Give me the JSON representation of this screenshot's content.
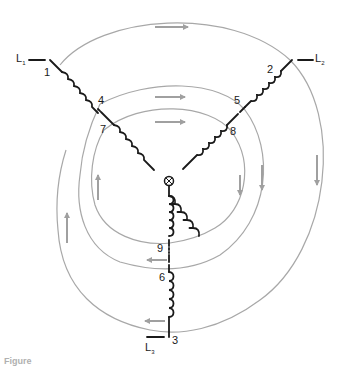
{
  "figure": {
    "caption_partial": "Figure",
    "colors": {
      "winding": "#1a1a1a",
      "flux_line": "#a8a8a8",
      "flux_arrow": "#a0a0a0",
      "background": "#ffffff"
    }
  },
  "lines": [
    {
      "id": "L1",
      "label": "L",
      "sub": "1"
    },
    {
      "id": "L2",
      "label": "L",
      "sub": "2"
    },
    {
      "id": "L3",
      "label": "L",
      "sub": "3"
    }
  ],
  "terminals": [
    "1",
    "2",
    "3",
    "4",
    "5",
    "6",
    "7",
    "8",
    "9"
  ],
  "flux_arrows": [
    {
      "position": "top-outer",
      "direction": "right"
    },
    {
      "position": "top-middle",
      "direction": "right"
    },
    {
      "position": "top-inner",
      "direction": "right"
    },
    {
      "position": "right-outer",
      "direction": "down"
    },
    {
      "position": "right-middle",
      "direction": "down"
    },
    {
      "position": "right-inner",
      "direction": "down"
    },
    {
      "position": "left-outer",
      "direction": "up"
    },
    {
      "position": "left-inner",
      "direction": "up"
    },
    {
      "position": "bottom-middle",
      "direction": "left"
    },
    {
      "position": "bottom-outer",
      "direction": "left"
    }
  ]
}
